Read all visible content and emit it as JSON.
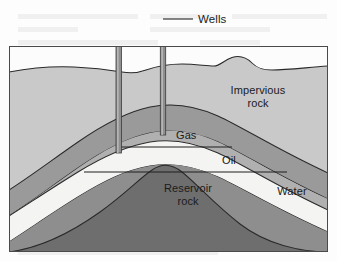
{
  "figure": {
    "background_color": "#fdfdfd",
    "frame_color": "#4a4a4a"
  },
  "labels": {
    "wells": "Wells",
    "impervious_rock_line1": "Impervious",
    "impervious_rock_line2": "rock",
    "gas": "Gas",
    "oil": "Oil",
    "reservoir_rock_line1": "Reservoir",
    "reservoir_rock_line2": "rock",
    "water": "Water"
  },
  "layers": [
    {
      "name": "impervious-rock",
      "label": "Impervious rock",
      "fill": "#c9c9c9"
    },
    {
      "name": "caprock-band",
      "label": "cap rock band",
      "fill": "#9a9a9a"
    },
    {
      "name": "water-band",
      "label": "Water",
      "fill": "#f2f2f0"
    },
    {
      "name": "gas-zone",
      "label": "Gas",
      "fill": "#b0b0b0"
    },
    {
      "name": "oil-zone",
      "label": "Oil",
      "fill": "#8e8e8e"
    },
    {
      "name": "reservoir-rock",
      "label": "Reservoir rock",
      "fill": "#6e6e6e"
    }
  ],
  "wells": [
    {
      "name": "left-well",
      "depth_label": "deep",
      "bottom_zone": "Oil"
    },
    {
      "name": "right-well",
      "depth_label": "shallow",
      "bottom_zone": "Gas"
    }
  ],
  "colors": {
    "impervious_rock": "#c9c9c9",
    "cap_band": "#9a9a9a",
    "water_band": "#f2f2f0",
    "gas_zone": "#b0b0b0",
    "oil_zone": "#8e8e8e",
    "reservoir_rock": "#6e6e6e",
    "well_pipe": "#8a8a8a",
    "outline": "#2a2a2a",
    "text": "#1b1b1b"
  }
}
